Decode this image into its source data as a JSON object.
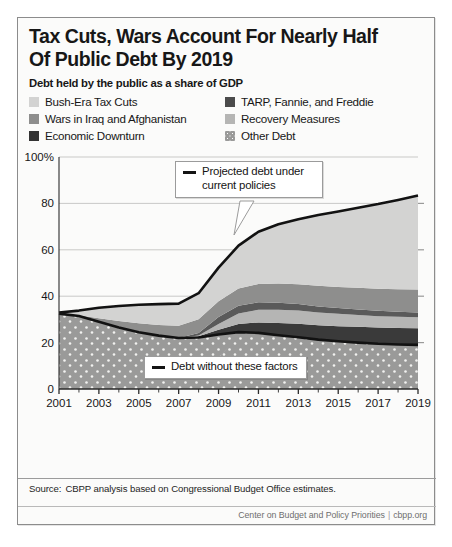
{
  "title": {
    "line1": "Tax Cuts, Wars Account For Nearly Half",
    "line2": "Of Public Debt By 2019"
  },
  "subtitle": "Debt held by the public as a share of GDP",
  "legend": [
    {
      "label": "Bush-Era Tax Cuts",
      "swatch": "sw-bush",
      "color": "#d3d3d2"
    },
    {
      "label": "TARP, Fannie, and Freddie",
      "swatch": "sw-tarp",
      "color": "#4b4b4b"
    },
    {
      "label": "Wars in Iraq and Afghanistan",
      "swatch": "sw-wars",
      "color": "#8e8e8d"
    },
    {
      "label": "Recovery Measures",
      "swatch": "sw-recov",
      "color": "#b5b5b4"
    },
    {
      "label": "Economic Downturn",
      "swatch": "sw-down",
      "color": "#333333"
    },
    {
      "label": "Other Debt",
      "swatch": "sw-other",
      "color": "#9a9a99"
    }
  ],
  "annotations": {
    "projected": "Projected debt under current policies",
    "without": "Debt without these factors"
  },
  "source": {
    "label": "Source:",
    "text": "CBPP analysis based on Congressional Budget Office estimates."
  },
  "credit": {
    "org": "Center on Budget and Policy Priorities",
    "site": "cbpp.org"
  },
  "chart_data": {
    "type": "area",
    "title": "Tax Cuts, Wars Account For Nearly Half Of Public Debt By 2019",
    "subtitle": "Debt held by the public as a share of GDP",
    "xlabel": "",
    "ylabel": "Percent of GDP",
    "xlim": [
      2001,
      2019
    ],
    "ylim": [
      0,
      100
    ],
    "yticks": [
      0,
      20,
      40,
      60,
      80,
      100
    ],
    "ytick_labels": [
      "0",
      "20",
      "40",
      "60",
      "80",
      "100%"
    ],
    "xticks": [
      2001,
      2003,
      2005,
      2007,
      2009,
      2011,
      2013,
      2015,
      2017,
      2019
    ],
    "minor_xticks_every": 1,
    "grid": "horizontal",
    "legend_position": "above-plot",
    "stacked": true,
    "x": [
      2001,
      2002,
      2003,
      2004,
      2005,
      2006,
      2007,
      2008,
      2009,
      2010,
      2011,
      2012,
      2013,
      2014,
      2015,
      2016,
      2017,
      2018,
      2019
    ],
    "series": [
      {
        "name": "Other Debt",
        "values": [
          32.5,
          31.5,
          29.0,
          26.5,
          24.5,
          23.0,
          22.0,
          22.2,
          23.5,
          24.5,
          24.2,
          23.2,
          22.3,
          21.3,
          20.6,
          20.0,
          19.5,
          19.2,
          19.0
        ]
      },
      {
        "name": "Economic Downturn",
        "values": [
          0.0,
          0.0,
          0.0,
          0.0,
          0.0,
          0.0,
          0.0,
          0.5,
          2.0,
          3.5,
          4.5,
          5.2,
          5.8,
          6.2,
          6.5,
          6.8,
          7.0,
          7.1,
          7.2
        ]
      },
      {
        "name": "Recovery Measures",
        "values": [
          0.0,
          0.0,
          0.0,
          0.0,
          0.0,
          0.0,
          0.0,
          0.4,
          2.5,
          4.5,
          5.5,
          5.8,
          5.7,
          5.5,
          5.3,
          5.1,
          4.9,
          4.8,
          4.7
        ]
      },
      {
        "name": "TARP, Fannie, and Freddie",
        "values": [
          0.0,
          0.0,
          0.0,
          0.0,
          0.0,
          0.0,
          0.0,
          1.0,
          3.0,
          3.4,
          3.2,
          3.0,
          2.8,
          2.6,
          2.5,
          2.4,
          2.3,
          2.2,
          2.1
        ]
      },
      {
        "name": "Wars in Iraq and Afghanistan",
        "values": [
          0.0,
          0.3,
          1.5,
          2.8,
          3.8,
          4.6,
          5.3,
          6.0,
          6.8,
          7.4,
          7.9,
          8.3,
          8.6,
          8.9,
          9.1,
          9.3,
          9.5,
          9.7,
          9.9
        ]
      },
      {
        "name": "Bush-Era Tax Cuts",
        "values": [
          0.5,
          2.0,
          4.5,
          6.5,
          8.0,
          9.0,
          9.5,
          11.0,
          14.5,
          18.5,
          22.5,
          25.5,
          28.0,
          30.5,
          32.5,
          34.5,
          36.5,
          38.5,
          40.5
        ]
      }
    ],
    "lines": [
      {
        "name": "Projected debt under current policies",
        "style": "thick-black",
        "values": [
          33.0,
          33.8,
          35.0,
          35.8,
          36.3,
          36.6,
          36.8,
          41.3,
          52.3,
          61.8,
          67.8,
          71.0,
          73.2,
          75.0,
          76.5,
          78.1,
          79.7,
          81.5,
          83.4
        ]
      },
      {
        "name": "Debt without these factors",
        "style": "thick-black",
        "values": [
          32.5,
          31.5,
          29.0,
          26.5,
          24.5,
          23.0,
          22.0,
          22.2,
          23.5,
          24.5,
          24.2,
          23.2,
          22.3,
          21.3,
          20.6,
          20.0,
          19.5,
          19.2,
          19.0
        ]
      }
    ]
  }
}
